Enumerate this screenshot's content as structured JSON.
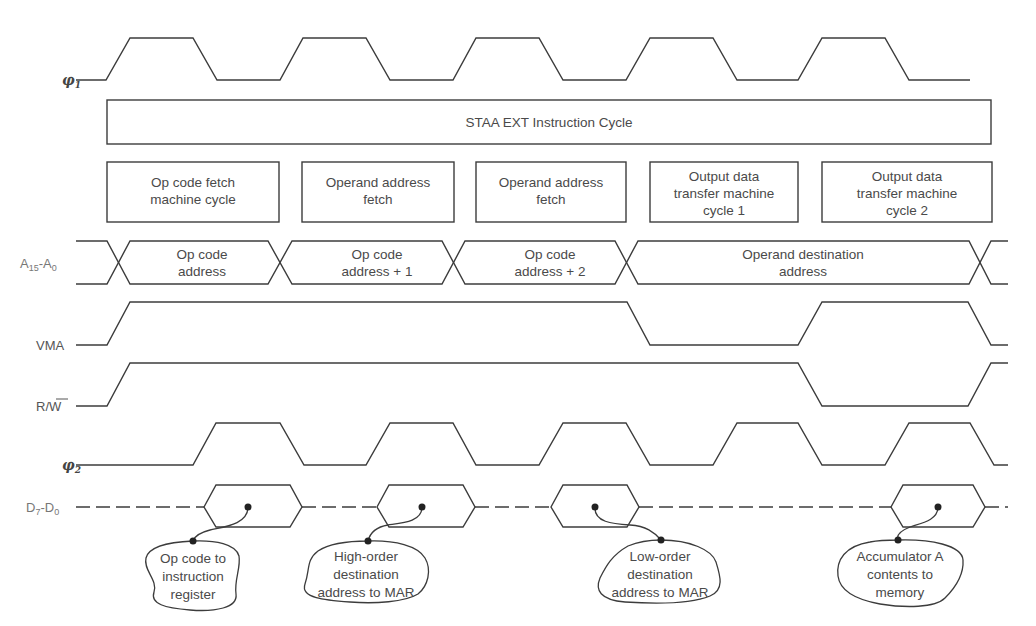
{
  "title": "STAA EXT Instruction Cycle",
  "signals": [
    {
      "id": "phi1",
      "label": "φ",
      "subscript": "1"
    },
    {
      "id": "addr",
      "label": "A",
      "subscript": "15",
      "label2": "A",
      "subscript2": "0",
      "separator": "-"
    },
    {
      "id": "vma",
      "label": "VMA"
    },
    {
      "id": "rw",
      "label": "R/",
      "overbar": "W"
    },
    {
      "id": "phi2",
      "label": "φ",
      "subscript": "2"
    },
    {
      "id": "data",
      "label": "D",
      "subscript": "7",
      "label2": "D",
      "subscript2": "0",
      "separator": "-"
    }
  ],
  "machine_cycles": [
    {
      "lines": [
        "Op code fetch",
        "machine cycle"
      ]
    },
    {
      "lines": [
        "Operand address",
        "fetch"
      ]
    },
    {
      "lines": [
        "Operand address",
        "fetch"
      ]
    },
    {
      "lines": [
        "Output data",
        "transfer machine",
        "cycle 1"
      ]
    },
    {
      "lines": [
        "Output data",
        "transfer machine",
        "cycle 2"
      ]
    }
  ],
  "address_bus": [
    {
      "lines": [
        "Op code",
        "address"
      ]
    },
    {
      "lines": [
        "Op code",
        "address + 1"
      ]
    },
    {
      "lines": [
        "Op code",
        "address + 2"
      ]
    },
    {
      "lines": [
        "Operand destination",
        "address"
      ]
    }
  ],
  "annotations": [
    {
      "lines": [
        "Op code to",
        "instruction",
        "register"
      ]
    },
    {
      "lines": [
        "High-order",
        "destination",
        "address to MAR"
      ]
    },
    {
      "lines": [
        "Low-order",
        "destination",
        "address to MAR"
      ]
    },
    {
      "lines": [
        "Accumulator A",
        "contents to",
        "memory"
      ]
    }
  ],
  "waveforms": {
    "phi1": "clock, 5 high pulses (one per machine cycle, first half)",
    "phi2": "clock, 5 high pulses (second half of each machine cycle)",
    "vma": [
      "low",
      "high",
      "high",
      "high",
      "low",
      "high",
      "low"
    ],
    "rw": [
      "low",
      "high",
      "high",
      "high",
      "high",
      "low",
      "high"
    ],
    "data_valid_windows": [
      1,
      2,
      3,
      5
    ]
  }
}
